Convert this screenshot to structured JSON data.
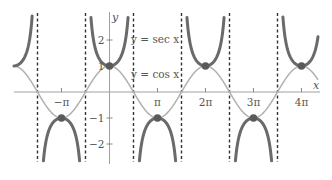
{
  "chart_data": {
    "type": "line",
    "title": "",
    "xlabel": "x",
    "ylabel": "y",
    "series": [
      {
        "name": "y = sec x",
        "function": "sec",
        "color": "#6a6a6a",
        "width": 3
      },
      {
        "name": "y = cos x",
        "function": "cos",
        "color": "#b0b0b0",
        "width": 1.5
      }
    ],
    "x_ticks": [
      {
        "value": -3.14159,
        "label": "−π"
      },
      {
        "value": 3.14159,
        "label": "π"
      },
      {
        "value": 6.28319,
        "label": "2π"
      },
      {
        "value": 9.42478,
        "label": "3π"
      },
      {
        "value": 12.56637,
        "label": "4π"
      }
    ],
    "y_ticks": [
      {
        "value": 2,
        "label": "2"
      },
      {
        "value": 1,
        "label": "1"
      },
      {
        "value": -1,
        "label": "−1"
      },
      {
        "value": -2,
        "label": "−2"
      }
    ],
    "asymptotes": [
      "−3π/2",
      "−π/2",
      "π/2",
      "3π/2",
      "5π/2",
      "7π/2"
    ],
    "asymptote_values": [
      -4.71239,
      -1.5708,
      1.5708,
      4.71239,
      7.85398,
      10.99557
    ],
    "intersection_points": [
      {
        "x": -3.14159,
        "y": -1
      },
      {
        "x": 0,
        "y": 1
      },
      {
        "x": 3.14159,
        "y": -1
      },
      {
        "x": 6.28319,
        "y": 1
      },
      {
        "x": 9.42478,
        "y": -1
      },
      {
        "x": 12.56637,
        "y": 1
      }
    ],
    "xlim": [
      -6.0,
      14.0
    ],
    "ylim": [
      -2.7,
      3.0
    ],
    "grid": false,
    "legend": "inline labels"
  },
  "labels": {
    "sec": "y = sec x",
    "cos": "y = cos x",
    "x_axis": "x",
    "y_axis": "y"
  }
}
